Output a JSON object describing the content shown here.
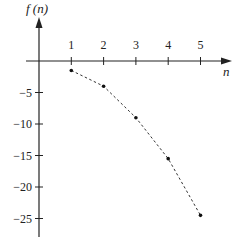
{
  "chart_data": {
    "type": "scatter",
    "title": "",
    "xlabel": "n",
    "ylabel": "f (n)",
    "x": [
      1,
      2,
      3,
      4,
      5
    ],
    "series": [
      {
        "name": "f(n)",
        "values": [
          -1.5,
          -4,
          -9,
          -15.5,
          -24.5
        ],
        "style": "dashed-line-with-points"
      }
    ],
    "x_ticks": [
      "1",
      "2",
      "3",
      "4",
      "5"
    ],
    "y_ticks": [
      "-5",
      "-10",
      "-15",
      "-20",
      "-25"
    ],
    "xlim": [
      -1,
      6
    ],
    "ylim": [
      -28,
      9
    ],
    "grid": false,
    "legend": "none"
  },
  "labels": {
    "y_axis_title": "f (n)",
    "x_axis_title": "n"
  },
  "colors": {
    "axis": "#222222",
    "series": "#333333"
  }
}
